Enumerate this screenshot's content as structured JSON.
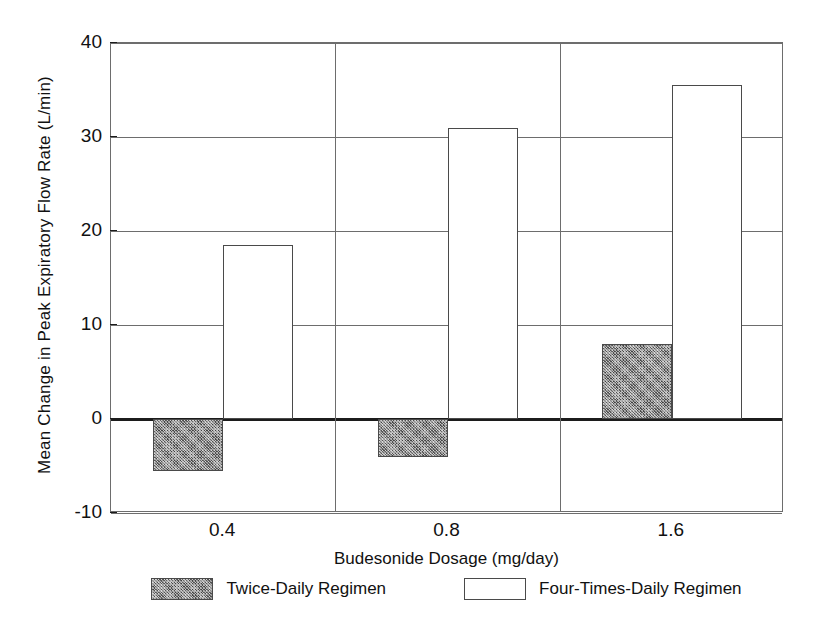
{
  "chart_data": {
    "type": "bar",
    "title": "",
    "xlabel": "Budesonide Dosage (mg/day)",
    "ylabel": "Mean Change in Peak Expiratory Flow Rate (L/min)",
    "categories": [
      "0.4",
      "0.8",
      "1.6"
    ],
    "series": [
      {
        "name": "Twice-Daily Regimen",
        "values": [
          -5.5,
          -4.0,
          8.0
        ],
        "style": "shaded"
      },
      {
        "name": "Four-Times-Daily Regimen",
        "values": [
          18.5,
          31.0,
          35.5
        ],
        "style": "open"
      }
    ],
    "ylim": [
      -10,
      40
    ],
    "yticks": [
      40,
      30,
      20,
      10,
      0,
      -10
    ],
    "ytick_labels": [
      "40",
      "30",
      "20",
      "10",
      "0",
      "-10"
    ],
    "grid": true,
    "gridlines_horizontal": [
      40,
      30,
      20,
      10,
      0,
      -10
    ],
    "panel_separators": 2,
    "legend_position": "bottom-center",
    "colors": {
      "shaded_fill": "#8d8d8d",
      "open_fill": "#ffffff",
      "outline": "#4a4a4a",
      "axis": "#6d6d6d",
      "zero_line": "#1c1c1c",
      "text": "#111111"
    }
  },
  "legend": {
    "entries": [
      {
        "label": "Twice-Daily Regimen",
        "style": "shaded"
      },
      {
        "label": "Four-Times-Daily Regimen",
        "style": "open"
      }
    ]
  }
}
